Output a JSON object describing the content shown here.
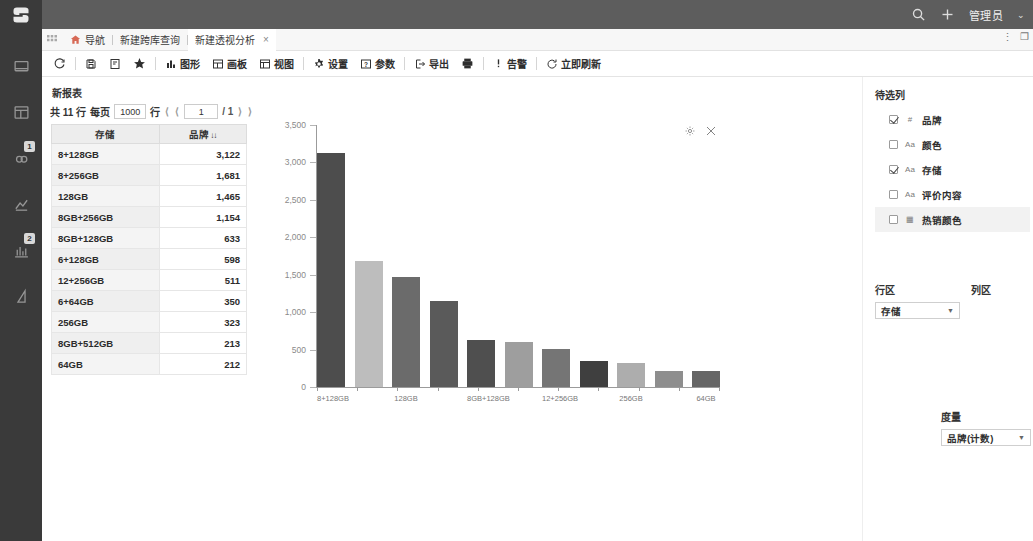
{
  "header": {
    "search_icon": "search-icon",
    "add_icon": "plus-icon",
    "user_label": "管理员",
    "caret": "⌄"
  },
  "sidebar": {
    "items": [
      {
        "icon": "dashboard-icon",
        "badge": ""
      },
      {
        "icon": "database-icon",
        "badge": ""
      },
      {
        "icon": "cloud-icon",
        "badge": "1"
      },
      {
        "icon": "analysis-icon",
        "badge": ""
      },
      {
        "icon": "chart-bar-icon",
        "badge": "2"
      },
      {
        "icon": "report-icon",
        "badge": ""
      }
    ]
  },
  "tabs": {
    "grid_icon": "grid-dots-icon",
    "home_icon": "home-icon",
    "items": [
      {
        "label": "导航",
        "closable": false,
        "active": false
      },
      {
        "label": "新建跨库查询",
        "closable": false,
        "active": false
      },
      {
        "label": "新建透视分析",
        "closable": true,
        "active": true
      }
    ],
    "close_glyph": "×",
    "window_menu": "⋮",
    "window_restore": "❐"
  },
  "toolbar": {
    "buttons": [
      {
        "label": "",
        "icon": "refresh-icon"
      },
      {
        "label": "",
        "icon": "save-icon"
      },
      {
        "label": "",
        "icon": "save-as-icon"
      },
      {
        "label": "",
        "icon": "star-icon"
      },
      {
        "label": "图形",
        "icon": "chart-icon"
      },
      {
        "label": "画板",
        "icon": "layout-icon"
      },
      {
        "label": "视图",
        "icon": "view-icon"
      },
      {
        "label": "设置",
        "icon": "gear-icon"
      },
      {
        "label": "参数",
        "icon": "param-icon"
      },
      {
        "label": "导出",
        "icon": "export-icon"
      },
      {
        "label": "",
        "icon": "print-icon"
      },
      {
        "label": "告警",
        "icon": "alert-icon"
      },
      {
        "label": "立即刷新",
        "icon": "refresh-now-icon"
      }
    ]
  },
  "report": {
    "title": "新报表",
    "pager": {
      "total_prefix": "共 11 行",
      "per_page_label": "每页",
      "per_page_value": "1000",
      "row_unit": "行",
      "first_arrow": "⟨",
      "prev_arrow": "⟨",
      "page_value": "1",
      "page_total": "/ 1",
      "next_arrow": "⟩",
      "last_arrow": "⟩"
    },
    "table": {
      "columns": [
        "存储",
        "品牌"
      ],
      "sort_glyph": "↓↓",
      "rows": [
        {
          "dim": "8+128GB",
          "val": "3,122"
        },
        {
          "dim": "8+256GB",
          "val": "1,681"
        },
        {
          "dim": "128GB",
          "val": "1,465"
        },
        {
          "dim": "8GB+256GB",
          "val": "1,154"
        },
        {
          "dim": "8GB+128GB",
          "val": "633"
        },
        {
          "dim": "6+128GB",
          "val": "598"
        },
        {
          "dim": "12+256GB",
          "val": "511"
        },
        {
          "dim": "6+64GB",
          "val": "350"
        },
        {
          "dim": "256GB",
          "val": "323"
        },
        {
          "dim": "8GB+512GB",
          "val": "213"
        },
        {
          "dim": "64GB",
          "val": "212"
        }
      ]
    }
  },
  "chart_tools": {
    "settings_icon": "gear-icon",
    "close_icon": "close-icon"
  },
  "chart_data": {
    "type": "bar",
    "title": "",
    "xlabel": "",
    "ylabel": "",
    "ylim": [
      0,
      3500
    ],
    "yticks": [
      0,
      500,
      1000,
      1500,
      2000,
      2500,
      3000,
      3500
    ],
    "ytick_labels": [
      "0",
      "500",
      "1,000",
      "1,500",
      "2,000",
      "2,500",
      "3,000",
      "3,500"
    ],
    "grid": false,
    "legend": false,
    "categories": [
      "8+128GB",
      "8+256GB",
      "128GB",
      "8GB+256GB",
      "8GB+128GB",
      "6+128GB",
      "12+256GB",
      "6+64GB",
      "256GB",
      "8GB+512GB",
      "64GB"
    ],
    "xtick_labels": [
      "8+128GB",
      "",
      "128GB",
      "",
      "8GB+128GB",
      "",
      "12+256GB",
      "",
      "256GB",
      "",
      "64GB"
    ],
    "values": [
      3122,
      1681,
      1465,
      1154,
      633,
      598,
      511,
      350,
      323,
      213,
      212
    ],
    "colors": [
      "#4d4d4d",
      "#bdbdbd",
      "#6b6b6b",
      "#5a5a5a",
      "#4f4f4f",
      "#9e9e9e",
      "#757575",
      "#3f3f3f",
      "#adadad",
      "#8e8e8e",
      "#666666"
    ]
  },
  "right_panel": {
    "fields_title": "待选列",
    "fields": [
      {
        "name": "品牌",
        "type": "#",
        "checked": true,
        "selected": false
      },
      {
        "name": "颜色",
        "type": "Aa",
        "checked": false,
        "selected": false
      },
      {
        "name": "存储",
        "type": "Aa",
        "checked": true,
        "selected": false
      },
      {
        "name": "评价内容",
        "type": "Aa",
        "checked": false,
        "selected": false
      },
      {
        "name": "热销颜色",
        "type": "▦",
        "checked": false,
        "selected": true
      }
    ],
    "row_zone": {
      "label": "行区",
      "value": "存储"
    },
    "col_zone": {
      "label": "列区",
      "value": ""
    },
    "measure": {
      "label": "度量",
      "value": "品牌(计数)"
    }
  }
}
